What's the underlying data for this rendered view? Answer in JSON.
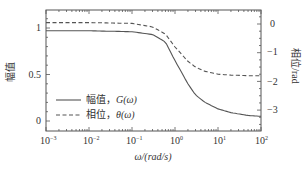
{
  "chart_data": {
    "type": "line",
    "title": "",
    "xlabel": "ω/(rad/s)",
    "ylabel_left": "幅值",
    "ylabel_right": "相位/rad",
    "xscale": "log",
    "xlim": [
      0.001,
      100
    ],
    "ylim_left": [
      -0.05,
      1.2
    ],
    "ylim_right": [
      -3.5,
      0.5
    ],
    "x_ticks": [
      "10-3",
      "10-2",
      "10-1",
      "100",
      "101",
      "102"
    ],
    "left_ticks": [
      "0",
      "0.5",
      "1"
    ],
    "right_ticks": [
      "0",
      "−1",
      "−2",
      "−3"
    ],
    "grid": false,
    "legend_position": "lower left",
    "x": [
      0.001,
      0.01,
      0.1,
      0.3,
      0.6,
      1,
      2,
      3,
      5,
      10,
      20,
      50,
      100
    ],
    "series": [
      {
        "name": "幅值，G(ω)",
        "axis": "left",
        "style": "solid",
        "values": [
          0.97,
          0.97,
          0.96,
          0.93,
          0.85,
          0.65,
          0.4,
          0.28,
          0.2,
          0.13,
          0.09,
          0.06,
          0.05
        ]
      },
      {
        "name": "相位，θ(ω)",
        "axis": "right",
        "style": "dashed",
        "values": [
          0.05,
          0.05,
          0.02,
          -0.1,
          -0.35,
          -0.8,
          -1.3,
          -1.5,
          -1.65,
          -1.75,
          -1.78,
          -1.8,
          -1.8
        ]
      }
    ]
  },
  "labels": {
    "x_axis": "ω/(rad/s)",
    "y_left": "幅值",
    "y_right": "相位/rad",
    "legend_magnitude_cn": "幅值，",
    "legend_magnitude_sym": "G(ω)",
    "legend_phase_cn": "相位，",
    "legend_phase_sym": "θ(ω)",
    "x_tick_base": "10",
    "x_tick_exps": [
      "−3",
      "−2",
      "−1",
      "0",
      "1",
      "2"
    ],
    "left_ticks": [
      "1",
      "0.5",
      "0"
    ],
    "right_ticks": [
      "0",
      "−1",
      "−2",
      "−3"
    ]
  }
}
